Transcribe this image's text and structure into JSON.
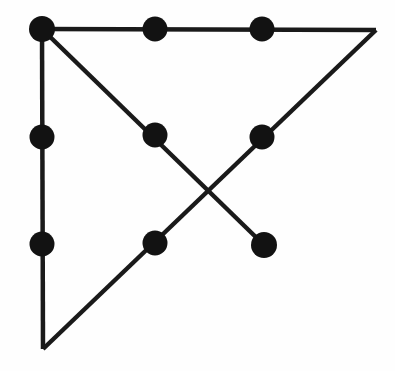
{
  "figure": {
    "type": "node-link-diagram",
    "canvas": {
      "width": 395,
      "height": 371
    },
    "colors": {
      "background": "#fefefe",
      "line": "#1a1a1a",
      "node_fill": "#121212"
    },
    "style": {
      "line_width": 4.5,
      "node_radius": 12.5
    },
    "vertices": [
      {
        "name": "top-left-corner",
        "x": 42,
        "y": 29,
        "has_node": true
      },
      {
        "name": "top-right-corner",
        "x": 376,
        "y": 30,
        "has_node": false
      },
      {
        "name": "bottom-left-corner",
        "x": 43,
        "y": 349,
        "has_node": false
      }
    ],
    "nodes": [
      {
        "id": "n1",
        "label": "top-left-node",
        "x": 42,
        "y": 29,
        "radius": 13
      },
      {
        "id": "n2",
        "label": "top-middle-node",
        "x": 155,
        "y": 29,
        "radius": 12.5
      },
      {
        "id": "n3",
        "label": "top-right-node",
        "x": 262,
        "y": 29,
        "radius": 12.5
      },
      {
        "id": "n4",
        "label": "left-middle-node",
        "x": 42,
        "y": 137,
        "radius": 12.5
      },
      {
        "id": "n5",
        "label": "center-node",
        "x": 155,
        "y": 135,
        "radius": 12.5
      },
      {
        "id": "n6",
        "label": "right-middle-node",
        "x": 262,
        "y": 137,
        "radius": 12.5
      },
      {
        "id": "n7",
        "label": "left-lower-node",
        "x": 42,
        "y": 244,
        "radius": 12.5
      },
      {
        "id": "n8",
        "label": "bottom-middle-node",
        "x": 155,
        "y": 243,
        "radius": 12.5
      },
      {
        "id": "n9",
        "label": "lower-right-endpoint-node",
        "x": 264,
        "y": 245,
        "radius": 13
      }
    ],
    "edges": [
      {
        "id": "e1",
        "label": "top-horizontal-edge",
        "x1": 42,
        "y1": 29,
        "x2": 376,
        "y2": 30
      },
      {
        "id": "e2",
        "label": "left-vertical-edge",
        "x1": 42,
        "y1": 29,
        "x2": 43,
        "y2": 349
      },
      {
        "id": "e3",
        "label": "hypotenuse-edge",
        "x1": 43,
        "y1": 349,
        "x2": 376,
        "y2": 30
      },
      {
        "id": "e4",
        "label": "descending-diagonal-edge",
        "x1": 42,
        "y1": 29,
        "x2": 264,
        "y2": 245
      }
    ],
    "crossing_point": {
      "name": "diagonal-intersection",
      "x": 212,
      "y": 190
    }
  }
}
